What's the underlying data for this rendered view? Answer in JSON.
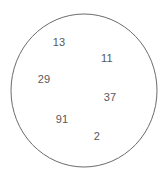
{
  "diagram": {
    "type": "set-circle-diagram",
    "background_color": "#ffffff",
    "circle": {
      "name": "set-boundary-circle",
      "stroke_color": "#6b6b6d",
      "fill_color": "#ffffff",
      "stroke_width": 1,
      "center_x": 84,
      "center_y": 90.5,
      "radius_x": 73,
      "radius_y": 76.5
    },
    "text_color": "#58585a",
    "font_size_px": 11,
    "elements": [
      {
        "label": "13",
        "x": 59,
        "y": 42
      },
      {
        "label": "11",
        "x": 107,
        "y": 58
      },
      {
        "label": "29",
        "x": 44,
        "y": 79
      },
      {
        "label": "37",
        "x": 110,
        "y": 97
      },
      {
        "label": "91",
        "x": 62,
        "y": 119
      },
      {
        "label": "2",
        "x": 97,
        "y": 136
      }
    ]
  }
}
